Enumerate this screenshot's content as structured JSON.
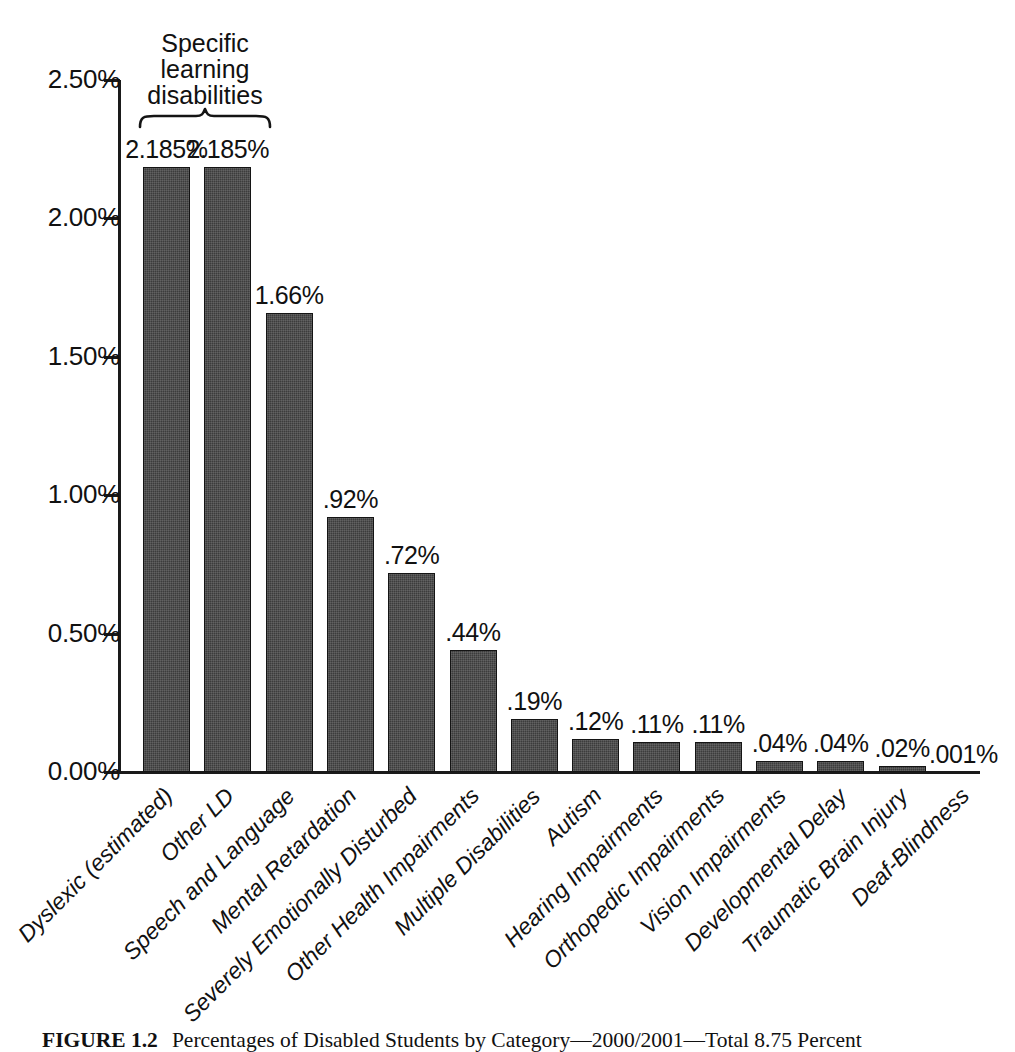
{
  "chart_data": {
    "type": "bar",
    "title": "",
    "xlabel": "",
    "ylabel": "",
    "ylim": [
      0,
      2.5
    ],
    "grid": false,
    "legend": "none",
    "y_ticks": [
      "0.00%",
      "0.50%",
      "1.00%",
      "1.50%",
      "2.00%",
      "2.50%"
    ],
    "y_tick_values": [
      0,
      0.5,
      1.0,
      1.5,
      2.0,
      2.5
    ],
    "categories": [
      "Dyslexic (estimated)",
      "Other LD",
      "Speech and Language",
      "Mental Retardation",
      "Severely Emotionally Disturbed",
      "Other Health Impairments",
      "Multiple Disabilities",
      "Autism",
      "Hearing Impairments",
      "Orthopedic Impairments",
      "Vision Impairments",
      "Developmental Delay",
      "Traumatic Brain Injury",
      "Deaf-Blindness"
    ],
    "values": [
      2.185,
      2.185,
      1.66,
      0.92,
      0.72,
      0.44,
      0.19,
      0.12,
      0.11,
      0.11,
      0.04,
      0.04,
      0.02,
      0.001
    ],
    "value_labels": [
      "2.185%",
      "2.185%",
      "1.66%",
      ".92%",
      ".72%",
      ".44%",
      ".19%",
      ".12%",
      ".11%",
      ".11%",
      ".04%",
      ".04%",
      ".02%",
      ".001%"
    ],
    "annotations": [
      {
        "text": "Specific learning disabilities",
        "lines": [
          "Specific",
          "learning",
          "disabilities"
        ],
        "spans_categories": [
          "Dyslexic (estimated)",
          "Other LD"
        ],
        "marker": "curly-brace"
      }
    ],
    "bar_color": "#3c3c3c",
    "axis_color": "#1a1a1a"
  },
  "caption": {
    "figure_number": "FIGURE 1.2",
    "text": "Percentages of Disabled Students by Category—2000/2001—Total 8.75 Percent"
  }
}
